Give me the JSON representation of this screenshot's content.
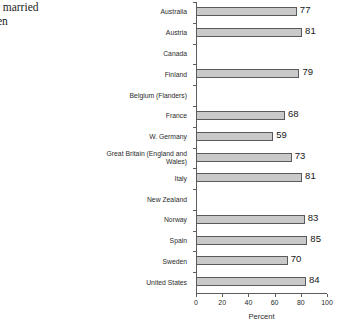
{
  "caption": {
    "text": "t ever married\nwomen"
  },
  "chart_data": {
    "type": "bar",
    "orientation": "horizontal",
    "title": "",
    "subtitle": "",
    "xlabel": "Percent",
    "ylabel": "",
    "xlim": [
      0,
      100
    ],
    "xticks": [
      0,
      20,
      40,
      60,
      80,
      100
    ],
    "grid": false,
    "legend": null,
    "bar_color": "#c9c9c9",
    "bar_edge_color": "#5a5a5a",
    "axis_color": "#5d5d5d",
    "categories": [
      "Australia",
      "Austria",
      "Canada",
      "Finland",
      "Belgium (Flanders)",
      "France",
      "W. Germany",
      "Great Britain (England and\nWales)",
      "Italy",
      "New Zealand",
      "Norway",
      "Spain",
      "Sweden",
      "United States"
    ],
    "values": [
      77,
      81,
      null,
      79,
      null,
      68,
      59,
      73,
      81,
      null,
      83,
      85,
      70,
      84
    ],
    "value_labels": [
      "77",
      "81",
      "",
      "79",
      "",
      "68",
      "59",
      "73",
      "81",
      "",
      "83",
      "85",
      "70",
      "84"
    ]
  }
}
